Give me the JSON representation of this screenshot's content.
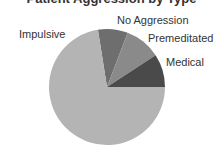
{
  "chart_data": {
    "type": "pie",
    "title": "Patient Aggression by Type",
    "title_visible": "clipped",
    "start_angle_deg": -9,
    "direction": "clockwise",
    "center": [
      107,
      87
    ],
    "radius": 58,
    "slices": [
      {
        "label": "No Aggression",
        "value": 8.3,
        "color": "#6e6e6e"
      },
      {
        "label": "Premeditated",
        "value": 10.0,
        "color": "#8a8a8a"
      },
      {
        "label": "Medical",
        "value": 9.2,
        "color": "#4a4a4a"
      },
      {
        "label": "Impulsive",
        "value": 72.5,
        "color": "#b4b4b4"
      }
    ],
    "labels": [
      {
        "text": "Impulsive",
        "x": 19,
        "y": 29
      },
      {
        "text": "No Aggression",
        "x": 117,
        "y": 15
      },
      {
        "text": "Premeditated",
        "x": 148,
        "y": 33
      },
      {
        "text": "Medical",
        "x": 166,
        "y": 57
      }
    ],
    "legend": "none",
    "grid": false
  }
}
